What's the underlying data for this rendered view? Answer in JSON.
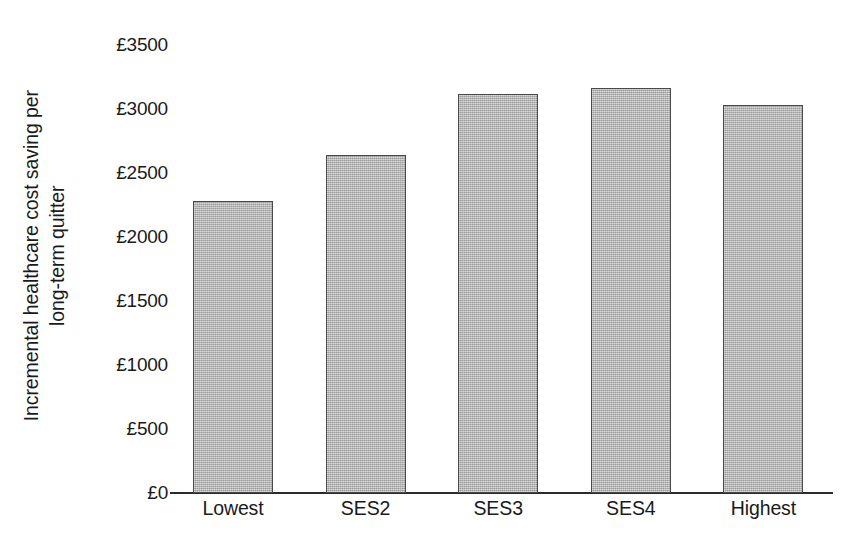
{
  "chart_data": {
    "type": "bar",
    "title": "",
    "subtitle": "",
    "xlabel": "",
    "ylabel": "Incremental healthcare cost saving per long-term quitter",
    "ylabel_lines": [
      "Incremental healthcare cost saving per",
      "long-term quitter"
    ],
    "currency_symbol": "£",
    "categories": [
      "Lowest",
      "SES2",
      "SES3",
      "SES4",
      "Highest"
    ],
    "values": [
      2280,
      2640,
      3115,
      3165,
      3030
    ],
    "ylim": [
      0,
      3500
    ],
    "ytick_values": [
      0,
      500,
      1000,
      1500,
      2000,
      2500,
      3000,
      3500
    ],
    "ytick_labels": [
      "£0",
      "£500",
      "£1000",
      "£1500",
      "£2000",
      "£2500",
      "£3000",
      "£3500"
    ],
    "grid": false,
    "legend": false,
    "legend_position": "none",
    "bar_fill_color": "#b9b9b9",
    "bar_border_color": "#4a4a4a",
    "axis_color": "#2b2b2b",
    "text_color": "#1a1a1a",
    "background_color": "#ffffff"
  }
}
